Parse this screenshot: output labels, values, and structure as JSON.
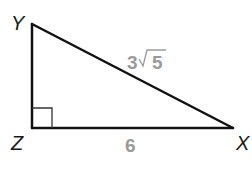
{
  "diagram": {
    "type": "right-triangle",
    "colors": {
      "stroke": "#111111",
      "vertex_label": "#1a1a1a",
      "side_label": "#9a9a9a",
      "background": "#ffffff"
    },
    "vertices": [
      {
        "id": "Y",
        "label": "Y",
        "x": 32,
        "y": 24
      },
      {
        "id": "Z",
        "label": "Z",
        "x": 32,
        "y": 128
      },
      {
        "id": "X",
        "label": "X",
        "x": 233,
        "y": 128
      }
    ],
    "right_angle_at": "Z",
    "sides": [
      {
        "from": "Y",
        "to": "X",
        "label": "3√5",
        "label_coefficient": "3",
        "label_radical": "5"
      },
      {
        "from": "Z",
        "to": "X",
        "label": "6"
      }
    ]
  }
}
